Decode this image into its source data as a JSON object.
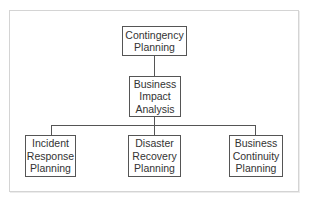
{
  "diagram": {
    "type": "hierarchy",
    "root": {
      "lines": [
        "Contingency",
        "Planning"
      ]
    },
    "middle": {
      "lines": [
        "Business",
        "Impact",
        "Analysis"
      ]
    },
    "children": [
      {
        "lines": [
          "Incident",
          "Response",
          "Planning"
        ]
      },
      {
        "lines": [
          "Disaster",
          "Recovery",
          "Planning"
        ]
      },
      {
        "lines": [
          "Business",
          "Continuity",
          "Planning"
        ]
      }
    ],
    "colors": {
      "border": "#555555",
      "text": "#333333",
      "frame": "#d4d4d4"
    }
  }
}
